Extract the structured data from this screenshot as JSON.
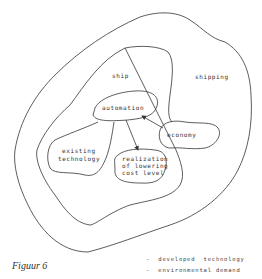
{
  "figure": {
    "caption": "Figuur 6",
    "regions": {
      "outer": "shipping",
      "middle": "ship"
    },
    "nodes": {
      "automation": "automation",
      "existing_technology": [
        "existing",
        "technology"
      ],
      "realization": [
        "realization",
        "of lowering",
        "cost level"
      ],
      "economy": "economy"
    },
    "arrows": [
      {
        "from": "automation",
        "to": "realization"
      },
      {
        "from": "economy",
        "to": "automation"
      }
    ],
    "legend": [
      "-  developed  technology",
      "-  environmental demand"
    ]
  }
}
